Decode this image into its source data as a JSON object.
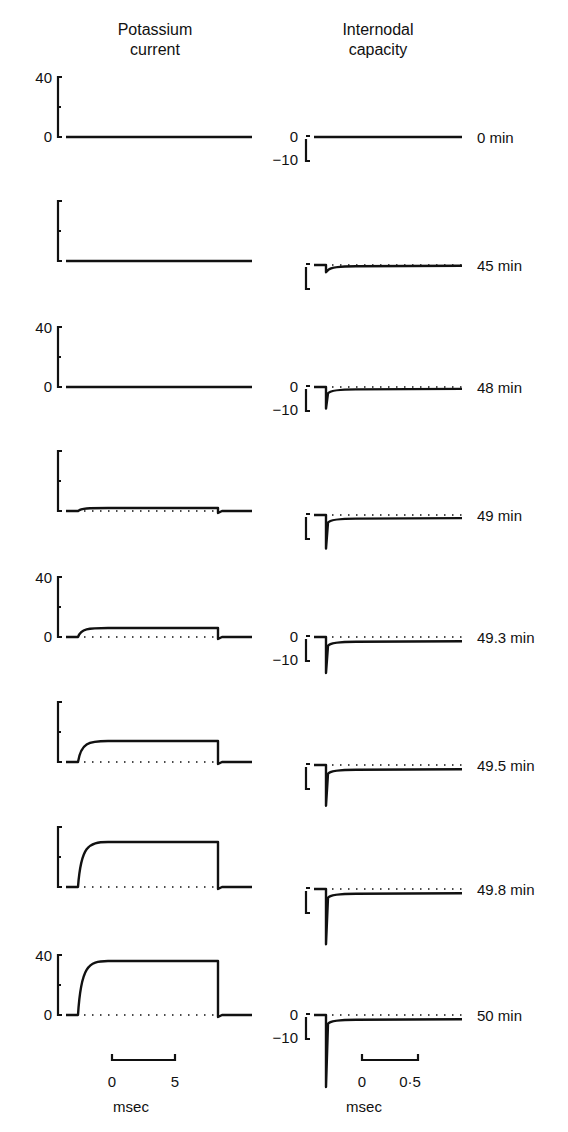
{
  "headers": {
    "left": [
      "Potassium",
      "current"
    ],
    "right": [
      "Internodal",
      "capacity"
    ]
  },
  "scale_bars": {
    "left": {
      "start": "0",
      "end": "5",
      "unit": "msec"
    },
    "right": {
      "start": "0",
      "end": "0·5",
      "unit": "msec"
    }
  },
  "rows": [
    {
      "time": "0 min",
      "left_axis": [
        "40",
        "0"
      ],
      "right_axis": [
        "0",
        "−10"
      ]
    },
    {
      "time": "45 min",
      "left_axis": [],
      "right_axis": []
    },
    {
      "time": "48 min",
      "left_axis": [
        "40",
        "0"
      ],
      "right_axis": [
        "0",
        "−10"
      ]
    },
    {
      "time": "49 min",
      "left_axis": [],
      "right_axis": []
    },
    {
      "time": "49.3 min",
      "left_axis": [
        "40",
        "0"
      ],
      "right_axis": [
        "0",
        "−10"
      ]
    },
    {
      "time": "49.5 min",
      "left_axis": [],
      "right_axis": []
    },
    {
      "time": "49.8 min",
      "left_axis": [],
      "right_axis": []
    },
    {
      "time": "50 min",
      "left_axis": [
        "40",
        "0"
      ],
      "right_axis": [
        "0",
        "−10"
      ]
    }
  ],
  "chart_data": [
    {
      "type": "line",
      "title": "Potassium current",
      "xlabel": "msec",
      "ylabel": "",
      "x_scale_bar": [
        0,
        5
      ],
      "ylim": [
        0,
        40
      ],
      "yticks": [
        0,
        40
      ],
      "series": [
        {
          "name": "0 min",
          "plateau": 0,
          "pulse_ms": [
            1.5,
            12.5
          ]
        },
        {
          "name": "45 min",
          "plateau": 0,
          "pulse_ms": [
            1.5,
            12.5
          ]
        },
        {
          "name": "48 min",
          "plateau": 0.5,
          "pulse_ms": [
            1.5,
            12.5
          ]
        },
        {
          "name": "49 min",
          "plateau": 2,
          "pulse_ms": [
            1.5,
            12.5
          ]
        },
        {
          "name": "49.3 min",
          "plateau": 6,
          "pulse_ms": [
            1.5,
            12.5
          ]
        },
        {
          "name": "49.5 min",
          "plateau": 14,
          "pulse_ms": [
            1.5,
            12.5
          ]
        },
        {
          "name": "49.8 min",
          "plateau": 30,
          "pulse_ms": [
            1.5,
            12.5
          ]
        },
        {
          "name": "50 min",
          "plateau": 36,
          "pulse_ms": [
            1.5,
            12.5
          ]
        }
      ]
    },
    {
      "type": "line",
      "title": "Internodal capacity",
      "xlabel": "msec",
      "ylabel": "",
      "x_scale_bar": [
        0,
        0.5
      ],
      "ylim": [
        -10,
        0
      ],
      "yticks": [
        -10,
        0
      ],
      "series": [
        {
          "name": "0 min",
          "peak": 0,
          "steady": 0
        },
        {
          "name": "45 min",
          "peak": -3,
          "steady": -0.5
        },
        {
          "name": "48 min",
          "peak": -9,
          "steady": -1
        },
        {
          "name": "49 min",
          "peak": -14,
          "steady": -1.5
        },
        {
          "name": "49.3 min",
          "peak": -15,
          "steady": -2
        },
        {
          "name": "49.5 min",
          "peak": -17,
          "steady": -2
        },
        {
          "name": "49.8 min",
          "peak": -23,
          "steady": -2
        },
        {
          "name": "50 min",
          "peak": -30,
          "steady": -2
        }
      ]
    }
  ]
}
